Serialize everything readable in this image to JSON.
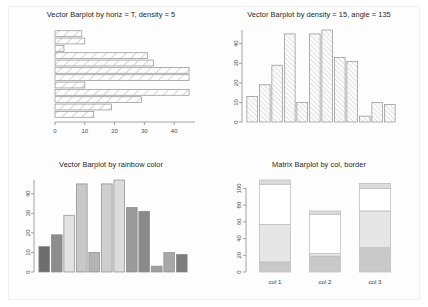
{
  "page": {
    "background": "#ffffff",
    "card_background": "#fdfdfd"
  },
  "panels": [
    {
      "name": "vector-barplot-horizontal",
      "title": "Vector Barplot by horiz = T, density = 5"
    },
    {
      "name": "vector-barplot-density-angle",
      "title": "Vector Barplot by density = 15, angle = 135"
    },
    {
      "name": "vector-barplot-rainbow",
      "title": "Vector Barplot by rainbow color"
    },
    {
      "name": "matrix-barplot",
      "title": "Matrix Barplot by col, border"
    }
  ],
  "chart_data": [
    {
      "type": "bar",
      "orientation": "horizontal",
      "title": "Vector Barplot by horiz = T, density = 5",
      "xlabel": "",
      "ylabel": "",
      "xlim": [
        0,
        47
      ],
      "ticks": [
        0,
        10,
        20,
        30,
        40
      ],
      "tick_labels": [
        "0",
        "10",
        "20",
        "30",
        "40"
      ],
      "grid": false,
      "fill": "white-with-diagonal-hatch",
      "hatch_density": 5,
      "categories": [
        "1",
        "2",
        "3",
        "4",
        "5",
        "6",
        "7",
        "8",
        "9",
        "10",
        "11",
        "12"
      ],
      "values": [
        9,
        10,
        3,
        31,
        33,
        45,
        45,
        10,
        45,
        29,
        19,
        13
      ]
    },
    {
      "type": "bar",
      "orientation": "vertical",
      "title": "Vector Barplot by density = 15, angle = 135",
      "xlabel": "",
      "ylabel": "",
      "ylim": [
        0,
        47
      ],
      "ticks": [
        0,
        10,
        20,
        30,
        40
      ],
      "tick_labels": [
        "0",
        "10",
        "20",
        "30",
        "40"
      ],
      "grid": false,
      "fill": "white-with-diagonal-hatch",
      "hatch_density": 15,
      "hatch_angle": 135,
      "categories": [
        "1",
        "2",
        "3",
        "4",
        "5",
        "6",
        "7",
        "8",
        "9",
        "10",
        "11",
        "12"
      ],
      "values": [
        13,
        19,
        29,
        45,
        10,
        45,
        47,
        33,
        31,
        3,
        10,
        9
      ]
    },
    {
      "type": "bar",
      "orientation": "vertical",
      "title": "Vector Barplot by rainbow color",
      "xlabel": "",
      "ylabel": "",
      "ylim": [
        0,
        47
      ],
      "ticks": [
        0,
        10,
        20,
        30,
        40
      ],
      "tick_labels": [
        "0",
        "10",
        "20",
        "30",
        "40"
      ],
      "grid": false,
      "categories": [
        "1",
        "2",
        "3",
        "4",
        "5",
        "6",
        "7",
        "8",
        "9",
        "10",
        "11",
        "12"
      ],
      "values": [
        13,
        19,
        29,
        45,
        10,
        45,
        47,
        33,
        31,
        3,
        10,
        9
      ],
      "colors": [
        "#6e6e6e",
        "#8d8d8d",
        "#e2e2e2",
        "#c8c8c8",
        "#b4b4b4",
        "#cfcfcf",
        "#dcdcdc",
        "#9a9a9a",
        "#8a8a8a",
        "#9f9f9f",
        "#a8a8a8",
        "#7d7d7d"
      ]
    },
    {
      "type": "bar",
      "orientation": "vertical",
      "stacked": true,
      "title": "Matrix Barplot by col, border",
      "xlabel": "",
      "ylabel": "",
      "ylim": [
        0,
        110
      ],
      "ticks": [
        0,
        20,
        40,
        60,
        80,
        100
      ],
      "tick_labels": [
        "0",
        "20",
        "40",
        "60",
        "80",
        "100"
      ],
      "grid": false,
      "categories": [
        "col 1",
        "col 2",
        "col 3"
      ],
      "series": [
        {
          "name": "row 1",
          "values": [
            12,
            19,
            29
          ],
          "color": "#c9c9c9"
        },
        {
          "name": "row 2",
          "values": [
            45,
            3,
            44
          ],
          "color": "#e6e6e6"
        },
        {
          "name": "row 3",
          "values": [
            48,
            47,
            27
          ],
          "color": "#ffffff"
        },
        {
          "name": "row 4",
          "values": [
            5,
            4,
            6
          ],
          "color": "#dcdcdc"
        }
      ],
      "totals": [
        110,
        73,
        106
      ]
    }
  ]
}
